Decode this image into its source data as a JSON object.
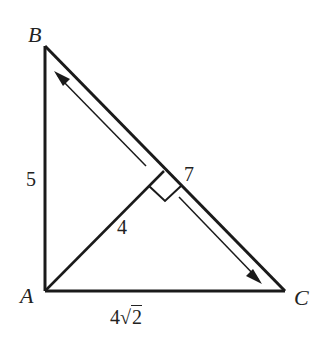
{
  "diagram": {
    "vertices": {
      "A": "A",
      "B": "B",
      "C": "C"
    },
    "side_labels": {
      "AB": "5",
      "AC": "4√2",
      "BC": "7",
      "altitude": "4"
    },
    "sqrt_parts": {
      "coef": "4",
      "radicand": "2"
    },
    "colors": {
      "stroke": "#1a1a1a",
      "background": "#ffffff"
    }
  }
}
